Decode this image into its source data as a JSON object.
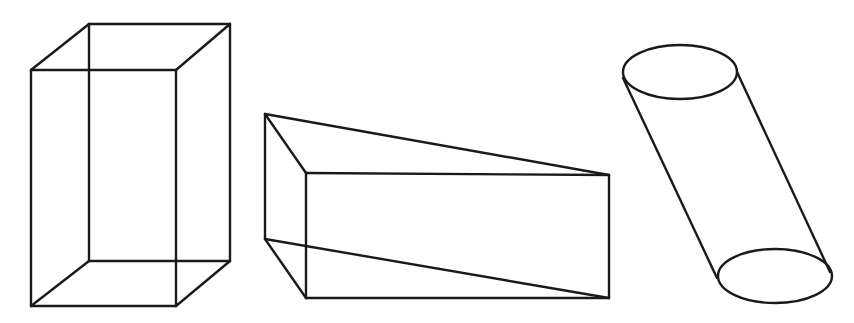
{
  "figure": {
    "background": "#ffffff",
    "stroke_color": "#1a1a1a",
    "shapes": [
      {
        "name": "rectangular-prism",
        "edges": [
          [
            89,
            24,
            230,
            24
          ],
          [
            31,
            70,
            176,
            70
          ],
          [
            31,
            70,
            89,
            24
          ],
          [
            176,
            70,
            230,
            24
          ],
          [
            31,
            70,
            31,
            306
          ],
          [
            176,
            70,
            176,
            306
          ],
          [
            230,
            24,
            230,
            261
          ],
          [
            89,
            24,
            89,
            261
          ],
          [
            89,
            261,
            230,
            261
          ],
          [
            31,
            306,
            176,
            306
          ],
          [
            31,
            306,
            89,
            261
          ],
          [
            176,
            306,
            230,
            261
          ]
        ]
      },
      {
        "name": "triangular-prism",
        "edges": [
          [
            265,
            114,
            609,
            175
          ],
          [
            265,
            114,
            306,
            173
          ],
          [
            306,
            173,
            609,
            175
          ],
          [
            265,
            114,
            265,
            239
          ],
          [
            306,
            173,
            306,
            298
          ],
          [
            609,
            175,
            609,
            298
          ],
          [
            265,
            239,
            609,
            298
          ],
          [
            265,
            239,
            306,
            298
          ],
          [
            306,
            298,
            609,
            298
          ]
        ]
      },
      {
        "name": "cylinder",
        "top_ellipse": {
          "cx": 680,
          "cy": 72,
          "rx": 57,
          "ry": 27
        },
        "bottom_ellipse": {
          "cx": 775,
          "cy": 276,
          "rx": 57,
          "ry": 27
        },
        "edges": [
          [
            623,
            78,
            717,
            278
          ],
          [
            737,
            72,
            830,
            272
          ]
        ]
      }
    ]
  }
}
